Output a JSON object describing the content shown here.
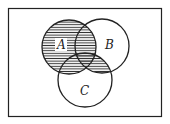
{
  "diagram": {
    "type": "venn",
    "universe": {
      "x": 8,
      "y": 8,
      "width": 154,
      "height": 109
    },
    "sets": [
      {
        "name": "A",
        "label": "A",
        "cx": 69,
        "cy": 47,
        "r": 27,
        "label_x": 61,
        "label_y": 48
      },
      {
        "name": "B",
        "label": "B",
        "cx": 102,
        "cy": 46,
        "r": 27,
        "label_x": 109,
        "label_y": 48
      },
      {
        "name": "C",
        "label": "C",
        "cx": 85,
        "cy": 80,
        "r": 27,
        "label_x": 84,
        "label_y": 95
      }
    ],
    "shaded_region": "A ∪ (B ∩ C)",
    "shading_style": "horizontal-lines",
    "colors": {
      "stroke": "#222222",
      "hatch": "#333333",
      "background": "#ffffff"
    }
  }
}
